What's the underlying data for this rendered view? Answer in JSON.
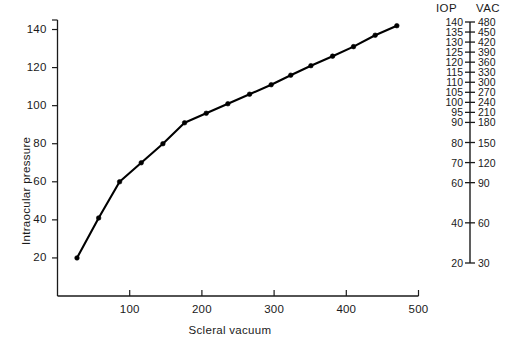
{
  "figure": {
    "background": "#ffffff",
    "ink": "#111111"
  },
  "chart_data": {
    "type": "line",
    "title": "",
    "xlabel": "Scleral vacuum",
    "ylabel": "Intraocular pressure",
    "xlim": [
      0,
      500
    ],
    "ylim": [
      0,
      145
    ],
    "grid": false,
    "legend": "none",
    "marker": "filled-circle",
    "line_color": "#000000",
    "xticks": [
      100,
      200,
      300,
      400,
      500
    ],
    "yticks": [
      20,
      40,
      60,
      80,
      100,
      120,
      140
    ],
    "series": [
      {
        "name": "Intraocular pressure vs scleral vacuum",
        "points": [
          {
            "x": 27,
            "y": 20
          },
          {
            "x": 57,
            "y": 41
          },
          {
            "x": 86,
            "y": 60
          },
          {
            "x": 116,
            "y": 70
          },
          {
            "x": 146,
            "y": 80
          },
          {
            "x": 176,
            "y": 91
          },
          {
            "x": 206,
            "y": 96
          },
          {
            "x": 236,
            "y": 101
          },
          {
            "x": 266,
            "y": 106
          },
          {
            "x": 296,
            "y": 111
          },
          {
            "x": 323,
            "y": 116
          },
          {
            "x": 351,
            "y": 121
          },
          {
            "x": 381,
            "y": 126
          },
          {
            "x": 410,
            "y": 131
          },
          {
            "x": 440,
            "y": 137
          },
          {
            "x": 470,
            "y": 142
          }
        ]
      }
    ]
  },
  "nomogram": {
    "header_iop": "IOP",
    "header_vac": "VAC",
    "rows": [
      {
        "iop": "140",
        "vac": "480"
      },
      {
        "iop": "135",
        "vac": "450"
      },
      {
        "iop": "130",
        "vac": "420"
      },
      {
        "iop": "125",
        "vac": "390"
      },
      {
        "iop": "120",
        "vac": "360"
      },
      {
        "iop": "115",
        "vac": "330"
      },
      {
        "iop": "110",
        "vac": "300"
      },
      {
        "iop": "105",
        "vac": "270"
      },
      {
        "iop": "100",
        "vac": "240"
      },
      {
        "iop": "95",
        "vac": "210"
      },
      {
        "iop": "90",
        "vac": "180"
      },
      {
        "iop": "80",
        "vac": "150"
      },
      {
        "iop": "70",
        "vac": "120"
      },
      {
        "iop": "60",
        "vac": "90"
      },
      {
        "iop": "40",
        "vac": "60"
      },
      {
        "iop": "20",
        "vac": "30"
      }
    ]
  }
}
